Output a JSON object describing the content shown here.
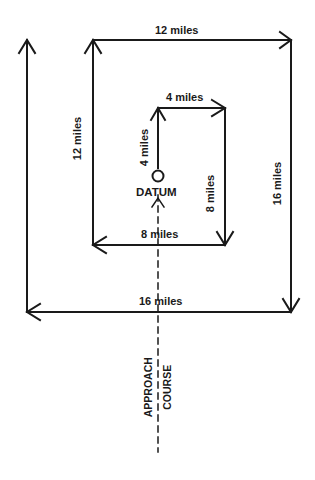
{
  "diagram": {
    "type": "expanding-square-search-pattern",
    "colors": {
      "line": "#1a1a1a",
      "background": "#ffffff"
    },
    "labels": {
      "leg1": "4 miles",
      "leg2": "4 miles",
      "leg3": "8 miles",
      "leg4": "8 miles",
      "leg5": "12 miles",
      "leg6": "12 miles",
      "leg7": "16 miles",
      "leg8": "16 miles",
      "datum": "DATUM",
      "approach_line1": "APPROACH",
      "approach_line2": "COURSE"
    }
  }
}
